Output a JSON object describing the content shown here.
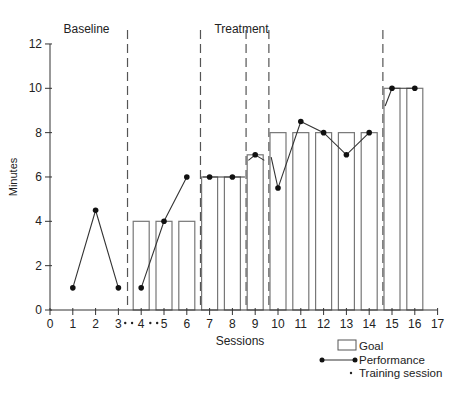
{
  "chart_data": {
    "type": "bar",
    "title": "",
    "xlabel": "Sessions",
    "ylabel": "Minutes",
    "xlim": [
      0,
      17
    ],
    "ylim": [
      0,
      12
    ],
    "x_ticks": [
      0,
      1,
      2,
      3,
      4,
      5,
      6,
      7,
      8,
      9,
      10,
      11,
      12,
      13,
      14,
      15,
      16,
      17
    ],
    "y_ticks": [
      0,
      2,
      4,
      6,
      8,
      10,
      12
    ],
    "grid": false,
    "phase_labels": [
      {
        "text": "Baseline",
        "x": 1.6
      },
      {
        "text": "Treatment",
        "x": 8.4
      }
    ],
    "phase_lines": [
      3.4,
      6.6,
      8.6,
      9.6,
      14.6
    ],
    "series": [
      {
        "name": "Goal",
        "type": "bar",
        "x": [
          4,
          5,
          6,
          7,
          8,
          9,
          10,
          11,
          12,
          13,
          14,
          15,
          16
        ],
        "values": [
          4,
          4,
          4,
          6,
          6,
          7,
          8,
          8,
          8,
          8,
          8,
          10,
          10
        ]
      },
      {
        "name": "Performance",
        "type": "line",
        "segments": [
          {
            "x": [
              1,
              2,
              3
            ],
            "values": [
              1,
              4.5,
              1
            ]
          },
          {
            "x": [
              4,
              5,
              6
            ],
            "values": [
              1,
              4,
              6
            ]
          },
          {
            "x": [
              6.7,
              7,
              8,
              8.55
            ],
            "values": [
              6,
              6,
              6,
              6
            ]
          },
          {
            "x": [
              8.7,
              9,
              9.4
            ],
            "values": [
              6.75,
              7,
              6.75
            ]
          },
          {
            "x": [
              9.7,
              10,
              11,
              12,
              13,
              14
            ],
            "values": [
              6.9,
              5.5,
              8.5,
              8,
              7,
              8
            ]
          },
          {
            "x": [
              14.7,
              15,
              16
            ],
            "values": [
              9.2,
              10,
              10
            ]
          }
        ],
        "markers": [
          {
            "x": 1,
            "y": 1
          },
          {
            "x": 2,
            "y": 4.5
          },
          {
            "x": 3,
            "y": 1
          },
          {
            "x": 4,
            "y": 1
          },
          {
            "x": 5,
            "y": 4
          },
          {
            "x": 6,
            "y": 6
          },
          {
            "x": 7,
            "y": 6
          },
          {
            "x": 8,
            "y": 6
          },
          {
            "x": 9,
            "y": 7
          },
          {
            "x": 10,
            "y": 5.5
          },
          {
            "x": 11,
            "y": 8.5
          },
          {
            "x": 12,
            "y": 8
          },
          {
            "x": 13,
            "y": 7
          },
          {
            "x": 14,
            "y": 8
          },
          {
            "x": 15,
            "y": 10
          },
          {
            "x": 16,
            "y": 10
          }
        ]
      },
      {
        "name": "Training session",
        "type": "marker",
        "x": [
          3.3,
          3.6,
          4.4,
          4.7
        ]
      }
    ],
    "legend": {
      "position": "bottom-right",
      "entries": [
        "Goal",
        "Performance",
        "Training session"
      ]
    }
  }
}
